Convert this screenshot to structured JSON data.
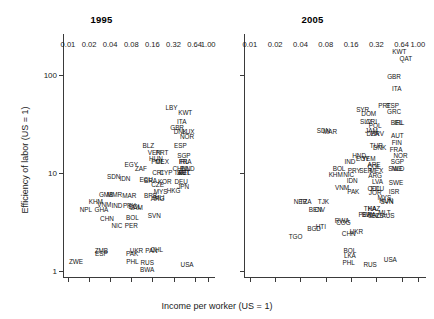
{
  "figure": {
    "xlabel": "Income per worker (US = 1)",
    "ylabel": "Efficiency of labor (US = 1)",
    "xticks": [
      "0.01",
      "0.02",
      "0.04",
      "0.08",
      "0.16",
      "0.32",
      "0.64",
      "1.00"
    ],
    "yticks": [
      "1",
      "10",
      "100"
    ],
    "panels": [
      {
        "title": "1995"
      },
      {
        "title": "2005"
      }
    ]
  },
  "chart_data": {
    "type": "scatter",
    "xlabel": "Income per worker (US = 1)",
    "ylabel": "Efficiency of labor (US = 1)",
    "xscale": "log",
    "yscale": "log",
    "xlim": [
      0.0085,
      1.25
    ],
    "ylim": [
      0.85,
      260
    ],
    "xticks": [
      0.01,
      0.02,
      0.04,
      0.08,
      0.16,
      0.32,
      0.64,
      1.0
    ],
    "yticks": [
      1,
      10,
      100
    ],
    "grid": false,
    "legend": "none",
    "point_labels": "ISO3 country codes",
    "panels": [
      {
        "name": "1995",
        "points": [
          {
            "label": "LBY",
            "x": 0.3,
            "y": 46
          },
          {
            "label": "KWT",
            "x": 0.47,
            "y": 41
          },
          {
            "label": "ITA",
            "x": 0.42,
            "y": 33
          },
          {
            "label": "GBR",
            "x": 0.36,
            "y": 29
          },
          {
            "label": "DNK",
            "x": 0.4,
            "y": 26
          },
          {
            "label": "LUX",
            "x": 0.52,
            "y": 26
          },
          {
            "label": "NOR",
            "x": 0.5,
            "y": 23
          },
          {
            "label": "BLZ",
            "x": 0.14,
            "y": 19
          },
          {
            "label": "ESP",
            "x": 0.4,
            "y": 19
          },
          {
            "label": "VEN",
            "x": 0.17,
            "y": 16
          },
          {
            "label": "PRT",
            "x": 0.22,
            "y": 16
          },
          {
            "label": "SGP",
            "x": 0.45,
            "y": 15
          },
          {
            "label": "HUN",
            "x": 0.18,
            "y": 14
          },
          {
            "label": "MEX",
            "x": 0.22,
            "y": 13
          },
          {
            "label": "POL",
            "x": 0.19,
            "y": 13
          },
          {
            "label": "IRL",
            "x": 0.45,
            "y": 13
          },
          {
            "label": "FRA",
            "x": 0.47,
            "y": 13
          },
          {
            "label": "EGY",
            "x": 0.08,
            "y": 12
          },
          {
            "label": "ZAF",
            "x": 0.11,
            "y": 11
          },
          {
            "label": "CHL",
            "x": 0.38,
            "y": 11
          },
          {
            "label": "FIN",
            "x": 0.47,
            "y": 11
          },
          {
            "label": "NLD",
            "x": 0.52,
            "y": 11
          },
          {
            "label": "CRI",
            "x": 0.19,
            "y": 10
          },
          {
            "label": "CYP",
            "x": 0.25,
            "y": 10
          },
          {
            "label": "ISR",
            "x": 0.4,
            "y": 10
          },
          {
            "label": "AUT",
            "x": 0.45,
            "y": 10
          },
          {
            "label": "BEL",
            "x": 0.46,
            "y": 10
          },
          {
            "label": "SDN",
            "x": 0.045,
            "y": 9.0
          },
          {
            "label": "IDN",
            "x": 0.065,
            "y": 8.6
          },
          {
            "label": "ECU",
            "x": 0.13,
            "y": 8.4
          },
          {
            "label": "BRA",
            "x": 0.15,
            "y": 8.2
          },
          {
            "label": "KOR",
            "x": 0.24,
            "y": 8.0
          },
          {
            "label": "DEU",
            "x": 0.41,
            "y": 8.0
          },
          {
            "label": "CZE",
            "x": 0.19,
            "y": 7.6
          },
          {
            "label": "JPN",
            "x": 0.44,
            "y": 7.2
          },
          {
            "label": "MYS",
            "x": 0.21,
            "y": 6.4
          },
          {
            "label": "HKG",
            "x": 0.32,
            "y": 6.6
          },
          {
            "label": "GMB",
            "x": 0.035,
            "y": 6.0
          },
          {
            "label": "MMR",
            "x": 0.046,
            "y": 6.0
          },
          {
            "label": "MAR",
            "x": 0.075,
            "y": 5.8
          },
          {
            "label": "BRB",
            "x": 0.15,
            "y": 5.8
          },
          {
            "label": "MLI",
            "x": 0.2,
            "y": 5.6
          },
          {
            "label": "ARG",
            "x": 0.19,
            "y": 5.4
          },
          {
            "label": "KHM",
            "x": 0.025,
            "y": 5.0
          },
          {
            "label": "VNM",
            "x": 0.033,
            "y": 4.7
          },
          {
            "label": "IND",
            "x": 0.05,
            "y": 4.6
          },
          {
            "label": "PRY",
            "x": 0.075,
            "y": 4.6
          },
          {
            "label": "BOL",
            "x": 0.09,
            "y": 4.5
          },
          {
            "label": "JAM",
            "x": 0.095,
            "y": 4.4
          },
          {
            "label": "NPL",
            "x": 0.018,
            "y": 4.2
          },
          {
            "label": "GHA",
            "x": 0.03,
            "y": 4.2
          },
          {
            "label": "CHN",
            "x": 0.036,
            "y": 3.4
          },
          {
            "label": "BOL",
            "x": 0.083,
            "y": 3.5
          },
          {
            "label": "SVN",
            "x": 0.17,
            "y": 3.6
          },
          {
            "label": "NIC",
            "x": 0.05,
            "y": 2.9
          },
          {
            "label": "PER",
            "x": 0.08,
            "y": 2.9
          },
          {
            "label": "ZMB",
            "x": 0.03,
            "y": 1.6
          },
          {
            "label": "ESP",
            "x": 0.03,
            "y": 1.5
          },
          {
            "label": "PAK",
            "x": 0.082,
            "y": 1.5
          },
          {
            "label": "UKR",
            "x": 0.095,
            "y": 1.6
          },
          {
            "label": "PAN",
            "x": 0.155,
            "y": 1.6
          },
          {
            "label": "CHL",
            "x": 0.185,
            "y": 1.65
          },
          {
            "label": "ZWE",
            "x": 0.013,
            "y": 1.25
          },
          {
            "label": "PHL",
            "x": 0.083,
            "y": 1.25
          },
          {
            "label": "RUS",
            "x": 0.135,
            "y": 1.2
          },
          {
            "label": "BWA",
            "x": 0.135,
            "y": 1.02
          },
          {
            "label": "USA",
            "x": 0.5,
            "y": 1.15
          }
        ]
      },
      {
        "name": "2005",
        "points": [
          {
            "label": "KWT",
            "x": 0.6,
            "y": 170
          },
          {
            "label": "QAT",
            "x": 0.72,
            "y": 145
          },
          {
            "label": "GBR",
            "x": 0.52,
            "y": 95
          },
          {
            "label": "ITA",
            "x": 0.56,
            "y": 72
          },
          {
            "label": "PRT",
            "x": 0.4,
            "y": 48
          },
          {
            "label": "ESP",
            "x": 0.5,
            "y": 48
          },
          {
            "label": "GRC",
            "x": 0.52,
            "y": 42
          },
          {
            "label": "SYR",
            "x": 0.22,
            "y": 44
          },
          {
            "label": "DOM",
            "x": 0.26,
            "y": 40
          },
          {
            "label": "SLV",
            "x": 0.24,
            "y": 33
          },
          {
            "label": "CRI",
            "x": 0.28,
            "y": 33
          },
          {
            "label": "POL",
            "x": 0.31,
            "y": 30
          },
          {
            "label": "BEL",
            "x": 0.56,
            "y": 32
          },
          {
            "label": "IRL",
            "x": 0.6,
            "y": 32
          },
          {
            "label": "SDN",
            "x": 0.075,
            "y": 27
          },
          {
            "label": "MAR",
            "x": 0.09,
            "y": 26
          },
          {
            "label": "JAM",
            "x": 0.28,
            "y": 27
          },
          {
            "label": "DZA",
            "x": 0.29,
            "y": 25
          },
          {
            "label": "HRV",
            "x": 0.33,
            "y": 25
          },
          {
            "label": "AUT",
            "x": 0.57,
            "y": 24
          },
          {
            "label": "FIN",
            "x": 0.56,
            "y": 20
          },
          {
            "label": "TUR",
            "x": 0.32,
            "y": 19
          },
          {
            "label": "DNK",
            "x": 0.35,
            "y": 18
          },
          {
            "label": "FRA",
            "x": 0.55,
            "y": 17
          },
          {
            "label": "NOR",
            "x": 0.62,
            "y": 15
          },
          {
            "label": "HND",
            "x": 0.2,
            "y": 15
          },
          {
            "label": "EGY",
            "x": 0.22,
            "y": 14
          },
          {
            "label": "YEM",
            "x": 0.26,
            "y": 14
          },
          {
            "label": "SGP",
            "x": 0.57,
            "y": 13
          },
          {
            "label": "IND",
            "x": 0.155,
            "y": 13
          },
          {
            "label": "ARE",
            "x": 0.3,
            "y": 12
          },
          {
            "label": "COL",
            "x": 0.3,
            "y": 11.5
          },
          {
            "label": "SWE",
            "x": 0.54,
            "y": 11
          },
          {
            "label": "NLD",
            "x": 0.58,
            "y": 11
          },
          {
            "label": "BOL",
            "x": 0.115,
            "y": 11
          },
          {
            "label": "PRY",
            "x": 0.175,
            "y": 10.5
          },
          {
            "label": "SER",
            "x": 0.24,
            "y": 10.5
          },
          {
            "label": "MEX",
            "x": 0.32,
            "y": 10.5
          },
          {
            "label": "KHM",
            "x": 0.105,
            "y": 9.5
          },
          {
            "label": "NIC",
            "x": 0.15,
            "y": 9.5
          },
          {
            "label": "ARG",
            "x": 0.31,
            "y": 9.2
          },
          {
            "label": "IDN",
            "x": 0.165,
            "y": 8.2
          },
          {
            "label": "LVA",
            "x": 0.33,
            "y": 8.0
          },
          {
            "label": "SWE",
            "x": 0.55,
            "y": 7.8
          },
          {
            "label": "VNM",
            "x": 0.125,
            "y": 7.0
          },
          {
            "label": "PAK",
            "x": 0.17,
            "y": 6.4
          },
          {
            "label": "COL",
            "x": 0.3,
            "y": 6.8
          },
          {
            "label": "ECU",
            "x": 0.33,
            "y": 6.8
          },
          {
            "label": "JOR",
            "x": 0.31,
            "y": 6.2
          },
          {
            "label": "MYS",
            "x": 0.4,
            "y": 5.6
          },
          {
            "label": "ISR",
            "x": 0.52,
            "y": 6.4
          },
          {
            "label": "NER",
            "x": 0.04,
            "y": 5.0
          },
          {
            "label": "TZA",
            "x": 0.046,
            "y": 5.0
          },
          {
            "label": "TJK",
            "x": 0.075,
            "y": 5.0
          },
          {
            "label": "SVN",
            "x": 0.43,
            "y": 5.0
          },
          {
            "label": "HUN",
            "x": 0.42,
            "y": 5.2
          },
          {
            "label": "BEN",
            "x": 0.06,
            "y": 4.2
          },
          {
            "label": "CIV",
            "x": 0.068,
            "y": 4.2
          },
          {
            "label": "THA",
            "x": 0.27,
            "y": 4.3
          },
          {
            "label": "KAZ",
            "x": 0.3,
            "y": 4.3
          },
          {
            "label": "BWA",
            "x": 0.26,
            "y": 3.7
          },
          {
            "label": "PER",
            "x": 0.235,
            "y": 3.7
          },
          {
            "label": "CHL",
            "x": 0.3,
            "y": 3.6
          },
          {
            "label": "CZE",
            "x": 0.33,
            "y": 3.6
          },
          {
            "label": "MLT",
            "x": 0.4,
            "y": 3.9
          },
          {
            "label": "AUS",
            "x": 0.44,
            "y": 3.6
          },
          {
            "label": "RWA",
            "x": 0.125,
            "y": 3.2
          },
          {
            "label": "COG",
            "x": 0.13,
            "y": 3.1
          },
          {
            "label": "BGD",
            "x": 0.058,
            "y": 2.7
          },
          {
            "label": "HTI",
            "x": 0.07,
            "y": 2.8
          },
          {
            "label": "CHN",
            "x": 0.15,
            "y": 2.4
          },
          {
            "label": "UKR",
            "x": 0.185,
            "y": 2.5
          },
          {
            "label": "TGO",
            "x": 0.035,
            "y": 2.2
          },
          {
            "label": "BOL",
            "x": 0.155,
            "y": 1.6
          },
          {
            "label": "LKA",
            "x": 0.155,
            "y": 1.42
          },
          {
            "label": "PHL",
            "x": 0.15,
            "y": 1.22
          },
          {
            "label": "RUS",
            "x": 0.27,
            "y": 1.15
          },
          {
            "label": "USA",
            "x": 0.47,
            "y": 1.3
          }
        ]
      }
    ]
  }
}
